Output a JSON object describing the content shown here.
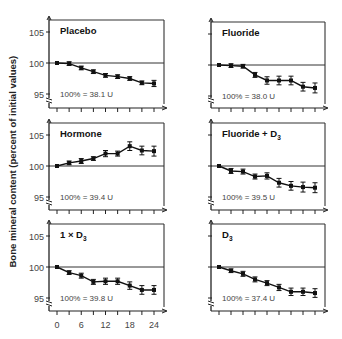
{
  "figure": {
    "ylabel": "Bone mineral content (percent of initial values)",
    "xticks": [
      "0",
      "6",
      "12",
      "18",
      "24"
    ]
  },
  "chart_data": [
    {
      "type": "line",
      "title": "Placebo",
      "annotation": "100% = 38.1 U",
      "x": [
        0,
        3,
        6,
        9,
        12,
        15,
        18,
        21,
        24
      ],
      "values": [
        100.0,
        99.9,
        99.2,
        98.6,
        98.0,
        97.8,
        97.5,
        96.8,
        96.7
      ],
      "errors": [
        0.0,
        0.3,
        0.3,
        0.3,
        0.3,
        0.3,
        0.3,
        0.3,
        0.5
      ],
      "xlabel": "",
      "ylabel": "Bone mineral content (percent of initial values)",
      "yticks": [
        95,
        100,
        105
      ],
      "ylim": [
        94,
        106.5
      ],
      "xlim": [
        0,
        25
      ],
      "reference_line": 100
    },
    {
      "type": "line",
      "title": "Fluoride",
      "annotation": "100% = 38.0 U",
      "x": [
        0,
        3,
        6,
        9,
        12,
        15,
        18,
        21,
        24
      ],
      "values": [
        100.0,
        99.9,
        99.8,
        98.4,
        97.5,
        97.5,
        97.5,
        96.5,
        96.3
      ],
      "errors": [
        0.0,
        0.3,
        0.3,
        0.4,
        0.6,
        0.7,
        0.7,
        0.7,
        0.8
      ],
      "xlabel": "",
      "ylabel": "",
      "yticks": [
        95,
        100,
        105
      ],
      "ylim": [
        94,
        106.5
      ],
      "xlim": [
        0,
        25
      ],
      "reference_line": 100
    },
    {
      "type": "line",
      "title": "Hormone",
      "annotation": "100% = 39.4 U",
      "x": [
        0,
        3,
        6,
        9,
        12,
        15,
        18,
        21,
        24
      ],
      "values": [
        100.0,
        100.5,
        100.8,
        101.2,
        102.0,
        102.0,
        103.2,
        102.5,
        102.4
      ],
      "errors": [
        0.0,
        0.3,
        0.4,
        0.3,
        0.5,
        0.4,
        0.7,
        0.7,
        0.8
      ],
      "xlabel": "",
      "ylabel": "",
      "yticks": [
        95,
        100,
        105
      ],
      "ylim": [
        94,
        106.5
      ],
      "xlim": [
        0,
        25
      ],
      "reference_line": 100
    },
    {
      "type": "line",
      "title": "Fluoride + D3",
      "annotation": "100% = 39.5 U",
      "x": [
        0,
        3,
        6,
        9,
        12,
        15,
        18,
        21,
        24
      ],
      "values": [
        100.0,
        99.2,
        99.1,
        98.3,
        98.4,
        97.3,
        96.8,
        96.6,
        96.5
      ],
      "errors": [
        0.0,
        0.4,
        0.4,
        0.4,
        0.5,
        0.7,
        0.7,
        0.8,
        0.8
      ],
      "xlabel": "",
      "ylabel": "",
      "yticks": [
        95,
        100,
        105
      ],
      "ylim": [
        94,
        106.5
      ],
      "xlim": [
        0,
        25
      ],
      "reference_line": 100
    },
    {
      "type": "line",
      "title": "1 × D3",
      "annotation": "100% = 39.8 U",
      "x": [
        0,
        3,
        6,
        9,
        12,
        15,
        18,
        21,
        24
      ],
      "values": [
        100.0,
        99.1,
        98.6,
        97.6,
        97.7,
        97.7,
        97.0,
        96.3,
        96.3
      ],
      "errors": [
        0.0,
        0.3,
        0.4,
        0.4,
        0.5,
        0.5,
        0.6,
        0.7,
        0.7
      ],
      "xlabel": "Months",
      "ylabel": "",
      "yticks": [
        95,
        100,
        105
      ],
      "ylim": [
        94,
        106.5
      ],
      "xlim": [
        0,
        25
      ],
      "reference_line": 100
    },
    {
      "type": "line",
      "title": "D3",
      "annotation": "100% = 37.4 U",
      "x": [
        0,
        3,
        6,
        9,
        12,
        15,
        18,
        21,
        24
      ],
      "values": [
        100.0,
        99.4,
        98.9,
        98.0,
        97.4,
        96.7,
        96.0,
        96.0,
        95.8
      ],
      "errors": [
        0.0,
        0.3,
        0.4,
        0.4,
        0.4,
        0.5,
        0.6,
        0.6,
        0.7
      ],
      "xlabel": "",
      "ylabel": "",
      "yticks": [
        95,
        100,
        105
      ],
      "ylim": [
        94,
        106.5
      ],
      "xlim": [
        0,
        25
      ],
      "reference_line": 100
    }
  ]
}
